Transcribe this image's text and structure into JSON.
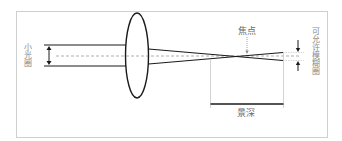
{
  "diagram": {
    "labels": {
      "aperture": "小光圈",
      "focal_point": "焦点",
      "circle_of_confusion": "可允许模糊圈",
      "depth_of_field": "景深"
    },
    "colors": {
      "frame": "#cfcfcf",
      "lines": "#1a1a1a",
      "axis_dashed": "#9a9a9a",
      "guides": "#c8c8c8",
      "label_text": "#8a8a8a"
    },
    "elements": [
      {
        "type": "lens",
        "shape": "ellipse"
      },
      {
        "type": "light-beam",
        "description": "narrow parallel beam entering lens"
      },
      {
        "type": "optical-axis",
        "style": "dashed"
      },
      {
        "type": "converging-rays",
        "description": "rays crossing at focal point"
      },
      {
        "type": "dimension",
        "label": "景深"
      }
    ]
  }
}
